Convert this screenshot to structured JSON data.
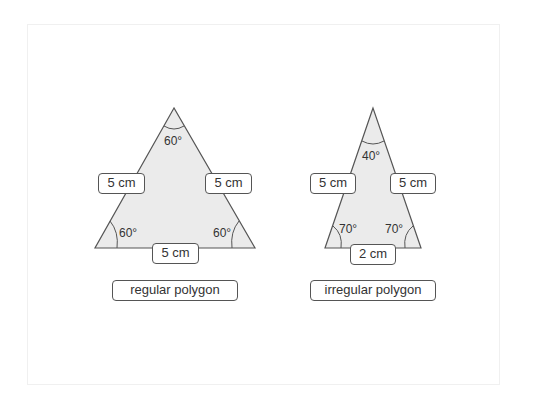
{
  "diagrams": {
    "regular": {
      "title": "regular polygon",
      "sides": [
        "5 cm",
        "5 cm",
        "5 cm"
      ],
      "angles": [
        "60°",
        "60°",
        "60°"
      ]
    },
    "irregular": {
      "title": "irregular polygon",
      "sides": [
        "5 cm",
        "5 cm",
        "2 cm"
      ],
      "angles": [
        "40°",
        "70°",
        "70°"
      ]
    }
  },
  "colors": {
    "fill": "#ebebeb",
    "stroke": "#555555",
    "text": "#333333"
  }
}
